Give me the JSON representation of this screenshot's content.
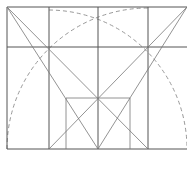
{
  "diagram": {
    "type": "geometric-construction",
    "colors": {
      "line": "#555555",
      "thin_line": "#777777",
      "dashed_arc": "#999999",
      "background": "#ffffff"
    },
    "outer_frame": {
      "x1": 7,
      "y1": 7,
      "x2": 187,
      "y2": 149
    },
    "center_square": {
      "x1": 49,
      "y1": 7,
      "x2": 148,
      "y2": 149
    },
    "center_vertical_x": 98,
    "horizontal_y": 47,
    "inner_rect": {
      "x1": 66,
      "y1": 98,
      "x2": 130,
      "y2": 149
    },
    "arcs": [
      {
        "cx": 148,
        "cy": 149,
        "r": 141,
        "style": "dashed"
      },
      {
        "cx": 49,
        "cy": 149,
        "r": 139,
        "style": "dashed"
      }
    ]
  }
}
